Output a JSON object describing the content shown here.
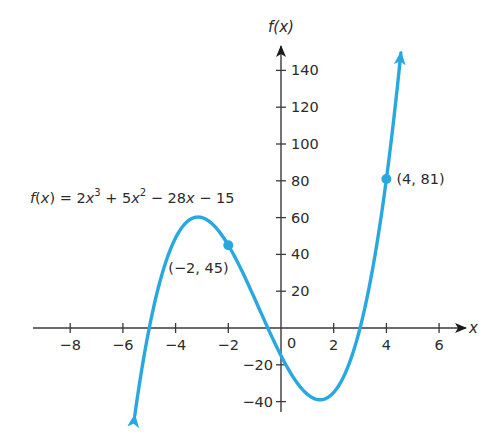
{
  "chart_data": {
    "type": "line",
    "title": "",
    "function": {
      "label_prefix": "f(x) = ",
      "terms": [
        {
          "text": "2x",
          "sup": "3"
        },
        {
          "text": " + 5x",
          "sup": "2"
        },
        {
          "text": " − 28x − 15",
          "sup": ""
        }
      ],
      "coefficients": [
        2,
        5,
        -28,
        -15
      ],
      "domain_plotted": [
        -5.55,
        4.55
      ]
    },
    "xlabel": "x",
    "ylabel": "f(x)",
    "xlim": [
      -9,
      7
    ],
    "ylim": [
      -45,
      155
    ],
    "x_ticks": [
      -8,
      -6,
      -4,
      -2,
      2,
      4,
      6
    ],
    "x_tick_labels": [
      "−8",
      "−6",
      "−4",
      "−2",
      "2",
      "4",
      "6"
    ],
    "y_ticks": [
      140,
      120,
      100,
      80,
      60,
      40,
      20,
      -20,
      -40
    ],
    "y_tick_labels": [
      "140",
      "120",
      "100",
      "80",
      "60",
      "40",
      "20",
      "−20",
      "−40"
    ],
    "origin_label": "0",
    "grid": false,
    "legend": null,
    "points": [
      {
        "x": -2,
        "y": 45,
        "label": "(−2, 45)"
      },
      {
        "x": 4,
        "y": 81,
        "label": "(4, 81)"
      }
    ],
    "series": [
      {
        "name": "f(x) = 2x^3 + 5x^2 - 28x - 15",
        "color": "#29a8e0",
        "arrows": "both ends"
      }
    ]
  },
  "colors": {
    "curve": "#29a8e0",
    "axis": "#1a1a1a",
    "text": "#2b2b2b"
  }
}
